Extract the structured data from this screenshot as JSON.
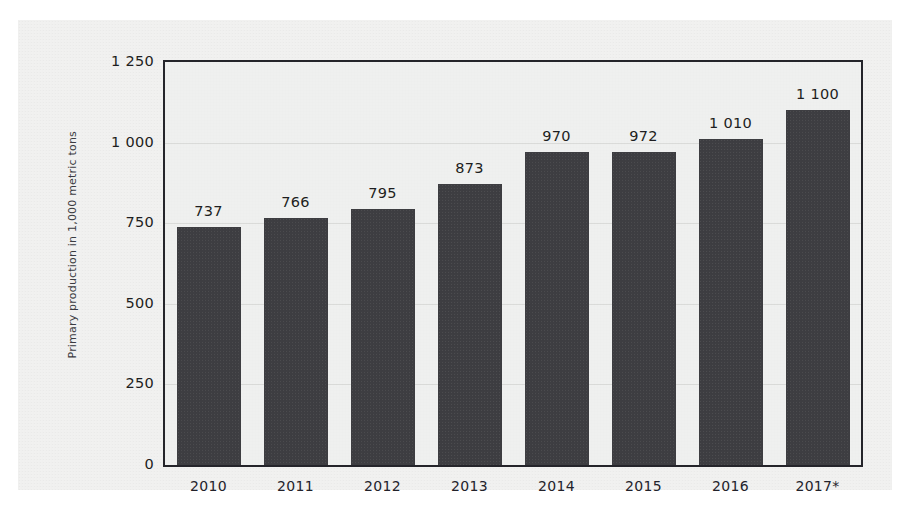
{
  "chart_data": {
    "type": "bar",
    "title": "",
    "subtitle": "",
    "xlabel": "",
    "ylabel": "Primary production in 1,000 metric tons",
    "categories": [
      "2010",
      "2011",
      "2012",
      "2013",
      "2014",
      "2015",
      "2016",
      "2017*"
    ],
    "values": [
      737,
      766,
      795,
      873,
      970,
      972,
      1010,
      1100
    ],
    "value_labels": [
      "737",
      "766",
      "795",
      "873",
      "970",
      "972",
      "1 010",
      "1 100"
    ],
    "ylim": [
      0,
      1250
    ],
    "yticks": [
      0,
      250,
      500,
      750,
      1000,
      1250
    ],
    "ytick_labels": [
      "0",
      "250",
      "500",
      "750",
      "1 000",
      "1 250"
    ],
    "grid": true,
    "grid_axis": "y",
    "legend": null,
    "legend_position": "none",
    "bar_color": "#3d3d41",
    "plot_background": "#eff0ef",
    "figure_background": "#f1f1f0",
    "frame_color": "#24242a",
    "gridline_color": "#dadbd9",
    "text_color": "#1d1d20",
    "footnote_marker": "*"
  }
}
